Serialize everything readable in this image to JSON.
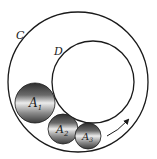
{
  "diagram": {
    "outer_circle": {
      "label": "C",
      "cx": 78,
      "cy": 82,
      "r": 70
    },
    "inner_circle": {
      "label": "D",
      "cx": 93,
      "cy": 82,
      "r": 41
    },
    "balls": [
      {
        "label": "A",
        "subscript": "1",
        "cx": 35,
        "cy": 103,
        "r": 20
      },
      {
        "label": "A",
        "subscript": "2",
        "cx": 63,
        "cy": 129,
        "r": 15
      },
      {
        "label": "A",
        "subscript": "3",
        "cx": 88,
        "cy": 136,
        "r": 13
      }
    ],
    "arrow": {
      "direction": "counterclockwise-up",
      "meaning": "rotation direction"
    },
    "colors": {
      "line": "#1a1a1a",
      "ball_dark": "#3a3a3a",
      "ball_light": "#e8e8e8"
    }
  }
}
